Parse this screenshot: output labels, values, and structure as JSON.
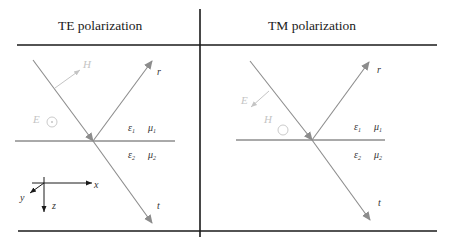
{
  "panels": [
    {
      "title": "TE polarization",
      "incident_field": "H",
      "normal_field": "E",
      "medium1": {
        "epsilon": "ε",
        "eps_sub": "1",
        "mu": "μ",
        "mu_sub": "1"
      },
      "medium2": {
        "epsilon": "ε",
        "eps_sub": "2",
        "mu": "μ",
        "mu_sub": "2"
      },
      "reflected_label": "r",
      "transmitted_label": "t"
    },
    {
      "title": "TM polarization",
      "incident_field": "E",
      "normal_field": "H",
      "medium1": {
        "epsilon": "ε",
        "eps_sub": "1",
        "mu": "μ",
        "mu_sub": "1"
      },
      "medium2": {
        "epsilon": "ε",
        "eps_sub": "2",
        "mu": "μ",
        "mu_sub": "2"
      },
      "reflected_label": "r",
      "transmitted_label": "t"
    }
  ],
  "axes": {
    "x": "x",
    "y": "y",
    "z": "z"
  },
  "colors": {
    "frame": "#1a1a1a",
    "ray": "#8c8c8c",
    "field": "#c4c4c4",
    "text": "#333333"
  }
}
